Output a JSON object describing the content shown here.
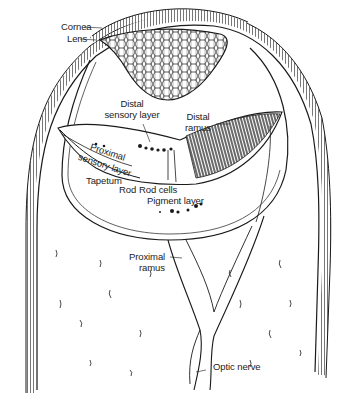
{
  "diagram": {
    "labels": {
      "cornea": "Cornea",
      "lens": "Lens",
      "distal_sensory_layer_1": "Distal",
      "distal_sensory_layer_2": "sensory layer",
      "distal_ramus_1": "Distal",
      "distal_ramus_2": "ramus",
      "proximal_sensory_layer_1": "Proximal",
      "proximal_sensory_layer_2": "sensory layer",
      "tapetum": "Tapetum",
      "rod": "Rod",
      "rod_cells": "Rod cells",
      "pigment_layer": "Pigment layer",
      "proximal_ramus_1": "Proximal",
      "proximal_ramus_2": "ramus",
      "optic_nerve": "Optic nerve"
    },
    "colors": {
      "ink": "#1a1a1a",
      "paper": "#ffffff"
    }
  }
}
